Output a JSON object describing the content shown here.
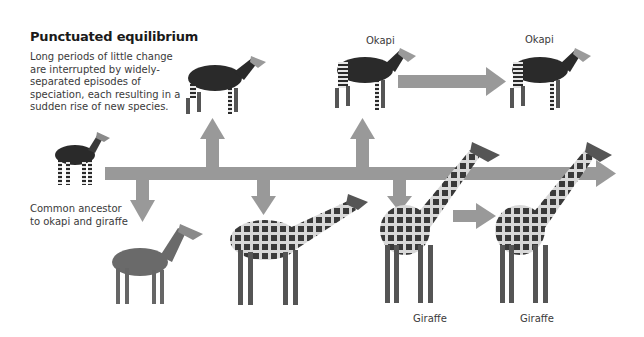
{
  "title": "Punctuated equilibrium",
  "description": "Long periods of little change are interrupted by widely-separated episodes of speciation, each resulting in a sudden rise of new species.",
  "labels": {
    "ancestor_line1": "Common ancestor",
    "ancestor_line2": "to okapi and giraffe",
    "okapi_1": "Okapi",
    "okapi_2": "Okapi",
    "giraffe_1": "Giraffe",
    "giraffe_2": "Giraffe"
  },
  "colors": {
    "arrow": "#999999",
    "text": "#333333",
    "animal_dark": "#2a2a2a",
    "animal_mid": "#6a6a6a"
  },
  "animals": [
    {
      "name": "common-ancestor",
      "kind": "okapi"
    },
    {
      "name": "early-okapi",
      "kind": "okapi"
    },
    {
      "name": "okapi",
      "kind": "okapi"
    },
    {
      "name": "okapi-later",
      "kind": "okapi"
    },
    {
      "name": "early-giraffid",
      "kind": "giraffid"
    },
    {
      "name": "intermediate-giraffe",
      "kind": "giraffe"
    },
    {
      "name": "giraffe",
      "kind": "giraffe"
    },
    {
      "name": "giraffe-later",
      "kind": "giraffe"
    }
  ]
}
